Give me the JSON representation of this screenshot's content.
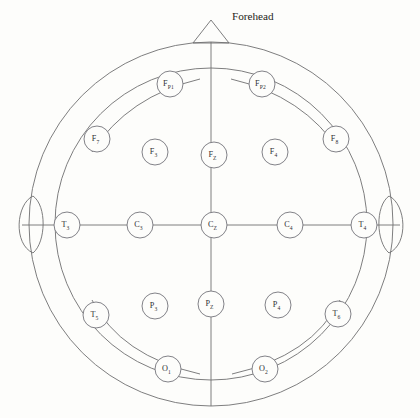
{
  "figure": {
    "background_color": "#fdfdfb",
    "line_color": "#6f6f70",
    "label_color": "#2f2f33"
  },
  "annotations": [
    {
      "id": "forehead",
      "text": "Forehead",
      "x": 232,
      "y": 17
    }
  ],
  "anatomy": {
    "head_outer": {
      "cx": 211,
      "cy": 224,
      "r": 182,
      "name": "head-outline"
    },
    "head_inner": {
      "cx": 211,
      "cy": 224,
      "r": 156,
      "name": "inner-head-circle"
    },
    "nose": {
      "apex_x": 211,
      "apex_y": 20,
      "base_left_x": 194,
      "base_left_y": 43,
      "base_right_x": 228,
      "base_right_y": 43
    },
    "ear_left": {
      "cx": 22,
      "cy": 224,
      "rx": 11,
      "ry": 30
    },
    "ear_right": {
      "cx": 400,
      "cy": 224,
      "rx": 11,
      "ry": 30
    }
  },
  "chart_data": {
    "type": "scatter",
    "xlabel": "",
    "ylabel": "",
    "grid": false,
    "legend": "none",
    "electrode_radius": 13,
    "categories": [
      "F_P1",
      "F_P2",
      "F7",
      "F3",
      "F_Z",
      "F4",
      "F8",
      "T3",
      "C3",
      "C_Z",
      "C4",
      "T4",
      "T5",
      "P3",
      "P_Z",
      "P4",
      "T6",
      "O1",
      "O2"
    ],
    "points": [
      {
        "id": "fp1",
        "label_main": "F",
        "label_sub": "P1",
        "x": 170,
        "y": 84,
        "group": "frontopolar",
        "hemisphere": "left"
      },
      {
        "id": "fp2",
        "label_main": "F",
        "label_sub": "P2",
        "x": 262,
        "y": 84,
        "group": "frontopolar",
        "hemisphere": "right"
      },
      {
        "id": "f7",
        "label_main": "F",
        "label_sub": "7",
        "x": 97,
        "y": 139,
        "group": "frontal",
        "hemisphere": "left"
      },
      {
        "id": "f3",
        "label_main": "F",
        "label_sub": "3",
        "x": 155,
        "y": 152,
        "group": "frontal",
        "hemisphere": "left"
      },
      {
        "id": "fz",
        "label_main": "F",
        "label_sub": "Z",
        "x": 214,
        "y": 155,
        "group": "frontal",
        "hemisphere": "midline"
      },
      {
        "id": "f4",
        "label_main": "F",
        "label_sub": "4",
        "x": 275,
        "y": 152,
        "group": "frontal",
        "hemisphere": "right"
      },
      {
        "id": "f8",
        "label_main": "F",
        "label_sub": "8",
        "x": 336,
        "y": 139,
        "group": "frontal",
        "hemisphere": "right"
      },
      {
        "id": "t3",
        "label_main": "T",
        "label_sub": "3",
        "x": 67,
        "y": 225,
        "group": "temporal",
        "hemisphere": "left"
      },
      {
        "id": "c3",
        "label_main": "C",
        "label_sub": "3",
        "x": 140,
        "y": 225,
        "group": "central",
        "hemisphere": "left"
      },
      {
        "id": "cz",
        "label_main": "C",
        "label_sub": "Z",
        "x": 214,
        "y": 225,
        "group": "central",
        "hemisphere": "midline"
      },
      {
        "id": "c4",
        "label_main": "C",
        "label_sub": "4",
        "x": 290,
        "y": 225,
        "group": "central",
        "hemisphere": "right"
      },
      {
        "id": "t4",
        "label_main": "T",
        "label_sub": "4",
        "x": 364,
        "y": 225,
        "group": "temporal",
        "hemisphere": "right"
      },
      {
        "id": "t5",
        "label_main": "T",
        "label_sub": "5",
        "x": 96,
        "y": 315,
        "group": "temporal",
        "hemisphere": "left"
      },
      {
        "id": "p3",
        "label_main": "P",
        "label_sub": "3",
        "x": 155,
        "y": 306,
        "group": "parietal",
        "hemisphere": "left"
      },
      {
        "id": "pz",
        "label_main": "P",
        "label_sub": "Z",
        "x": 211,
        "y": 304,
        "group": "parietal",
        "hemisphere": "midline"
      },
      {
        "id": "p4",
        "label_main": "P",
        "label_sub": "4",
        "x": 278,
        "y": 305,
        "group": "parietal",
        "hemisphere": "right"
      },
      {
        "id": "t6",
        "label_main": "T",
        "label_sub": "6",
        "x": 338,
        "y": 314,
        "group": "temporal",
        "hemisphere": "right"
      },
      {
        "id": "o1",
        "label_main": "O",
        "label_sub": "1",
        "x": 168,
        "y": 369,
        "group": "occipital",
        "hemisphere": "left"
      },
      {
        "id": "o2",
        "label_main": "O",
        "label_sub": "2",
        "x": 265,
        "y": 369,
        "group": "occipital",
        "hemisphere": "right"
      }
    ]
  }
}
